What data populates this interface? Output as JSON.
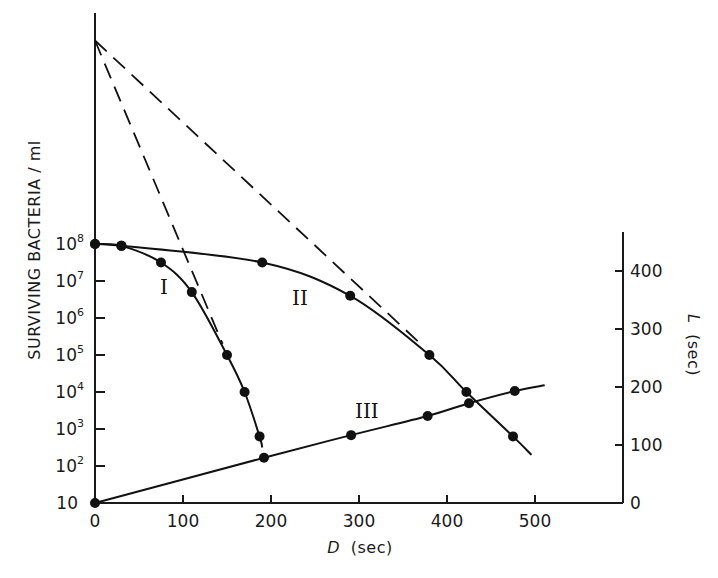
{
  "chart_data": {
    "type": "line",
    "title": "",
    "xlabel": "D (sec)",
    "xlabel_italic_part": "D",
    "xlabel_unit": "(sec)",
    "ylabel_left": "SURVIVING BACTERIA / ml",
    "ylabel_right": "L (sec)",
    "ylabel_right_italic_part": "L",
    "ylabel_right_unit": "(sec)",
    "x_range": [
      0,
      600
    ],
    "x_ticks": [
      0,
      100,
      200,
      300,
      400,
      500
    ],
    "x_tick_labels": [
      "0",
      "100",
      "200",
      "300",
      "400",
      "500"
    ],
    "y_left_scale": "log",
    "y_left_ticks": [
      10,
      100,
      1000,
      10000,
      100000,
      1000000,
      10000000,
      100000000
    ],
    "y_left_tick_labels": [
      {
        "base": "10",
        "exp": ""
      },
      {
        "base": "10",
        "exp": "2"
      },
      {
        "base": "10",
        "exp": "3"
      },
      {
        "base": "10",
        "exp": "4"
      },
      {
        "base": "10",
        "exp": "5"
      },
      {
        "base": "10",
        "exp": "6"
      },
      {
        "base": "10",
        "exp": "7"
      },
      {
        "base": "10",
        "exp": "8"
      }
    ],
    "y_right_range": [
      0,
      450
    ],
    "y_right_ticks": [
      0,
      100,
      200,
      300,
      400
    ],
    "y_right_tick_labels": [
      "0",
      "100",
      "200",
      "300",
      "400"
    ],
    "grid": false,
    "legend": "none (curves labeled inline I, II, III)",
    "series": [
      {
        "name": "I",
        "axis": "left",
        "style": "solid with markers",
        "points": [
          {
            "D": 0,
            "survivors_log10": 8.0
          },
          {
            "D": 30,
            "survivors_log10": 7.95
          },
          {
            "D": 75,
            "survivors_log10": 7.5
          },
          {
            "D": 110,
            "survivors_log10": 6.7
          },
          {
            "D": 150,
            "survivors_log10": 5.0
          },
          {
            "D": 170,
            "survivors_log10": 4.0
          },
          {
            "D": 187,
            "survivors_log10": 2.8
          }
        ],
        "line_end": {
          "D": 190,
          "survivors_log10": 2.5
        }
      },
      {
        "name": "II",
        "axis": "left",
        "style": "solid with markers",
        "points": [
          {
            "D": 0,
            "survivors_log10": 8.0
          },
          {
            "D": 30,
            "survivors_log10": 7.95
          },
          {
            "D": 190,
            "survivors_log10": 7.5
          },
          {
            "D": 290,
            "survivors_log10": 6.6
          },
          {
            "D": 380,
            "survivors_log10": 5.0
          },
          {
            "D": 422,
            "survivors_log10": 4.0
          },
          {
            "D": 475,
            "survivors_log10": 2.8
          }
        ],
        "line_end": {
          "D": 496,
          "survivors_log10": 2.3
        }
      },
      {
        "name": "III",
        "axis": "right",
        "style": "solid with markers",
        "points": [
          {
            "D": 0,
            "L": 0
          },
          {
            "D": 192,
            "L": 78
          },
          {
            "D": 291,
            "L": 117
          },
          {
            "D": 378,
            "L": 150
          },
          {
            "D": 425,
            "L": 172
          },
          {
            "D": 477,
            "L": 193
          }
        ],
        "line_end": {
          "D": 511,
          "L": 203
        }
      },
      {
        "name": "I extrapolation",
        "axis": "left",
        "style": "dashed",
        "points": [
          {
            "D": 0,
            "survivors_log10": 13.5
          },
          {
            "D": 145,
            "survivors_log10": 5.3
          }
        ]
      },
      {
        "name": "II extrapolation",
        "axis": "left",
        "style": "dashed",
        "points": [
          {
            "D": 0,
            "survivors_log10": 13.5
          },
          {
            "D": 370,
            "survivors_log10": 5.3
          }
        ]
      }
    ],
    "annotations": [
      {
        "text": "I",
        "near_series": "I"
      },
      {
        "text": "II",
        "near_series": "II"
      },
      {
        "text": "III",
        "near_series": "III"
      }
    ]
  },
  "labels": {
    "curve_I": "I",
    "curve_II": "II",
    "curve_III": "III",
    "ylabel_left": "SURVIVING BACTERIA / ml",
    "xlabel_var": "D",
    "xlabel_unit": "(sec)",
    "ylabel_right_var": "L",
    "ylabel_right_unit": "(sec)"
  }
}
